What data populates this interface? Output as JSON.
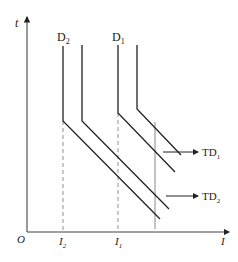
{
  "axes": {
    "y_label": "t",
    "x_label": "I",
    "origin_label": "O"
  },
  "curves": {
    "D2": {
      "label": "D",
      "sub": "2"
    },
    "D1": {
      "label": "D",
      "sub": "1"
    }
  },
  "x_ticks": [
    {
      "label": "I",
      "sub": "2"
    },
    {
      "label": "I",
      "sub": "1"
    }
  ],
  "annotations": {
    "TD1": {
      "label": "TD",
      "sub": "1"
    },
    "TD2": {
      "label": "TD",
      "sub": "2"
    }
  },
  "colors": {
    "line": "#222222",
    "dashed": "#777777",
    "guide": "#888888"
  }
}
